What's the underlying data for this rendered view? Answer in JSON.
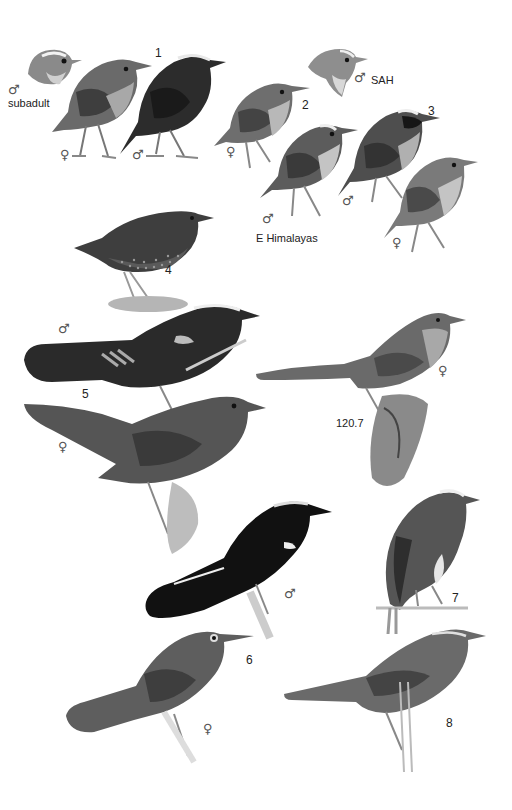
{
  "plate": {
    "background": "#ffffff",
    "palette": {
      "dark": "#1e1e1e",
      "mid": "#5a5a5a",
      "light": "#9a9a9a",
      "pale": "#cfcfcf",
      "moss": "#b5b5b5"
    }
  },
  "labels": {
    "n1": "1",
    "n2": "2",
    "n3": "3",
    "n4": "4",
    "n5": "5",
    "n6": "6",
    "n7": "7",
    "n8": "8",
    "n120_7": "120.7",
    "subadult": "subadult",
    "sah": "SAH",
    "e_himalayas": "E Himalayas"
  },
  "symbols": {
    "male": "♂",
    "female": "♀"
  }
}
